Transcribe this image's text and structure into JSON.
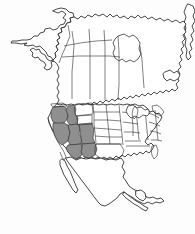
{
  "figure": {
    "kind": "distribution-range-map",
    "background_color": "#fdfdfd"
  },
  "style": {
    "land_fill": "#ffffff",
    "land_outline": "#1a1a1a",
    "subdivision_line": "#2b2b2b",
    "shaded_fill": "#8f8f8f",
    "shaded_outline": "#2b2b2b"
  },
  "legend": {
    "shaded_meaning": "shaded range area",
    "unshaded_meaning": "outside range"
  },
  "continent": {
    "name": "North America",
    "countries": [
      {
        "name": "Canada",
        "shaded": false
      },
      {
        "name": "United States",
        "shaded": "partial"
      },
      {
        "name": "Mexico",
        "shaded": false
      },
      {
        "name": "Greenland",
        "shaded": false
      }
    ]
  },
  "regions": {
    "alaska": {
      "label": "Alaska",
      "shaded": false
    },
    "hudson_bay": {
      "label": "Hudson Bay",
      "shaded": false
    },
    "great_lakes": {
      "label": "Great Lakes",
      "shaded": false
    },
    "baja_california": {
      "label": "Baja California",
      "shaded": false
    },
    "florida": {
      "label": "Florida",
      "shaded": false
    },
    "yucatan": {
      "label": "Yucatan Peninsula",
      "shaded": false
    },
    "newfoundland": {
      "label": "Newfoundland",
      "shaded": false
    }
  },
  "shaded_states": [
    {
      "code": "OR",
      "name": "Oregon"
    },
    {
      "code": "ID",
      "name": "Idaho"
    },
    {
      "code": "NV",
      "name": "Nevada"
    },
    {
      "code": "UT",
      "name": "Utah"
    },
    {
      "code": "CO",
      "name": "Colorado"
    },
    {
      "code": "AZ",
      "name": "Arizona"
    },
    {
      "code": "NM",
      "name": "New Mexico"
    }
  ],
  "unshaded_states": [
    {
      "code": "WA",
      "name": "Washington"
    },
    {
      "code": "CA",
      "name": "California"
    },
    {
      "code": "MT",
      "name": "Montana"
    },
    {
      "code": "WY",
      "name": "Wyoming"
    },
    {
      "code": "ND",
      "name": "North Dakota"
    },
    {
      "code": "SD",
      "name": "South Dakota"
    },
    {
      "code": "NE",
      "name": "Nebraska"
    },
    {
      "code": "KS",
      "name": "Kansas"
    },
    {
      "code": "OK",
      "name": "Oklahoma"
    },
    {
      "code": "TX",
      "name": "Texas"
    },
    {
      "code": "MN",
      "name": "Minnesota"
    },
    {
      "code": "IA",
      "name": "Iowa"
    },
    {
      "code": "MO",
      "name": "Missouri"
    },
    {
      "code": "AR",
      "name": "Arkansas"
    },
    {
      "code": "LA",
      "name": "Louisiana"
    },
    {
      "code": "WI",
      "name": "Wisconsin"
    },
    {
      "code": "IL",
      "name": "Illinois"
    },
    {
      "code": "MI",
      "name": "Michigan"
    },
    {
      "code": "IN",
      "name": "Indiana"
    },
    {
      "code": "OH",
      "name": "Ohio"
    },
    {
      "code": "KY",
      "name": "Kentucky"
    },
    {
      "code": "TN",
      "name": "Tennessee"
    },
    {
      "code": "MS",
      "name": "Mississippi"
    },
    {
      "code": "AL",
      "name": "Alabama"
    },
    {
      "code": "GA",
      "name": "Georgia"
    },
    {
      "code": "FL",
      "name": "Florida"
    },
    {
      "code": "SC",
      "name": "South Carolina"
    },
    {
      "code": "NC",
      "name": "North Carolina"
    },
    {
      "code": "VA",
      "name": "Virginia"
    },
    {
      "code": "WV",
      "name": "West Virginia"
    },
    {
      "code": "MD",
      "name": "Maryland"
    },
    {
      "code": "PA",
      "name": "Pennsylvania"
    },
    {
      "code": "NY",
      "name": "New York"
    },
    {
      "code": "NJ",
      "name": "New Jersey"
    },
    {
      "code": "CT",
      "name": "Connecticut"
    },
    {
      "code": "MA",
      "name": "Massachusetts"
    },
    {
      "code": "VT",
      "name": "Vermont"
    },
    {
      "code": "NH",
      "name": "New Hampshire"
    },
    {
      "code": "ME",
      "name": "Maine"
    }
  ],
  "canadian_provinces": [
    {
      "code": "YT",
      "name": "Yukon"
    },
    {
      "code": "BC",
      "name": "British Columbia"
    },
    {
      "code": "AB",
      "name": "Alberta"
    },
    {
      "code": "SK",
      "name": "Saskatchewan"
    },
    {
      "code": "MB",
      "name": "Manitoba"
    },
    {
      "code": "ON",
      "name": "Ontario"
    },
    {
      "code": "QC",
      "name": "Quebec"
    },
    {
      "code": "NT",
      "name": "Northwest Territories"
    }
  ]
}
